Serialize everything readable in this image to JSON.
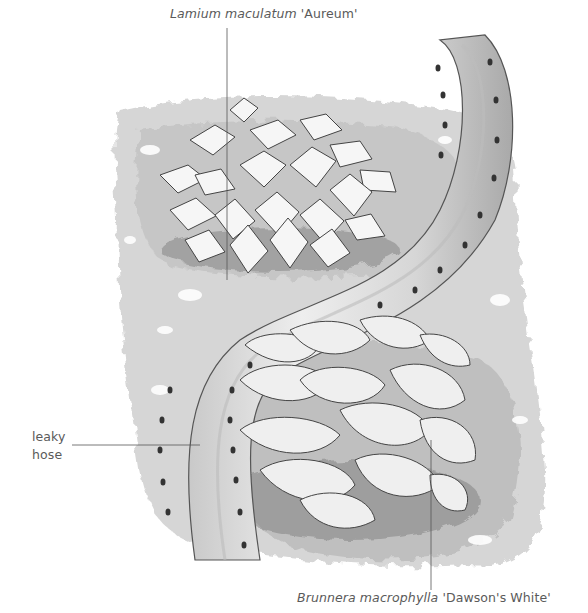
{
  "figure": {
    "labels": {
      "top": {
        "italic": "Lamium maculatum",
        "cultivar": " 'Aureum'"
      },
      "left": {
        "line1": "leaky",
        "line2": "hose"
      },
      "bottom": {
        "italic": "Brunnera macrophylla",
        "cultivar": " 'Dawson's White'"
      }
    },
    "colors": {
      "ink": "#4a4a4a",
      "soil": "#b8b8b8",
      "soil_dark": "#8a8a8a",
      "hose": "#d9d9d9",
      "hose_shade": "#a8a8a8",
      "leaf": "#f4f4f4",
      "label": "#5a5a5a"
    }
  }
}
